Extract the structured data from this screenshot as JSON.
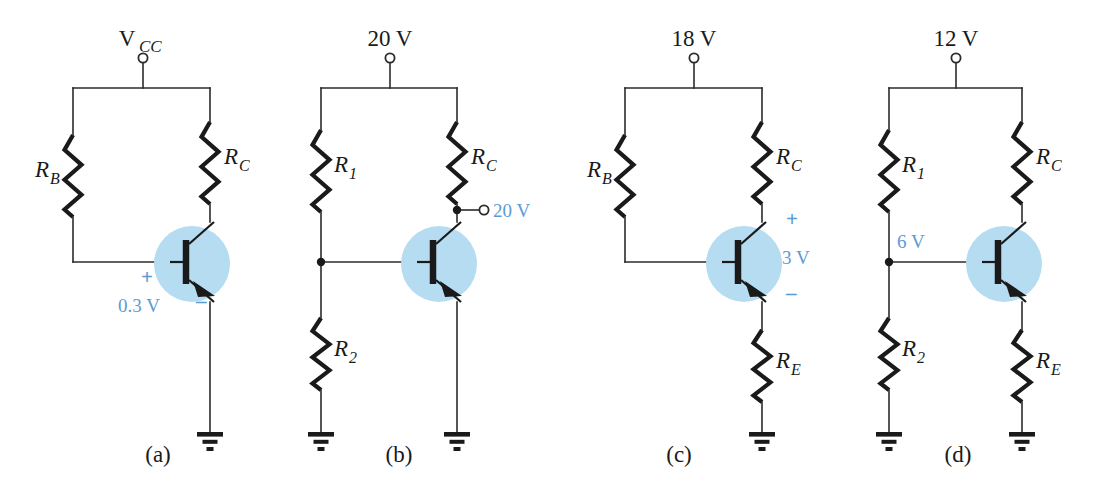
{
  "figure": {
    "width": 1094,
    "height": 503,
    "background": "#ffffff",
    "wire_color": "#2b2b2b",
    "ink_color": "#1a1a1a",
    "highlight_fill": "#b6dcf2",
    "annotation_color": "#5b9bd5"
  },
  "circuits": [
    {
      "id": "a",
      "caption": "(a)",
      "caption_x": 158,
      "caption_y": 462,
      "supply": {
        "label": "V",
        "sub": "CC",
        "x": 143,
        "terminal_y": 58,
        "rail_y": 88
      },
      "left_rail_x": 73,
      "right_rail_x": 210,
      "base_line_y": 262,
      "ground_y": 432,
      "resistors": [
        {
          "name": "R",
          "sub": "B",
          "x": 73,
          "y": 135,
          "h": 82,
          "label_side": "left",
          "label_dx": -34,
          "label_dy": 42
        },
        {
          "name": "R",
          "sub": "C",
          "x": 210,
          "y": 122,
          "h": 82,
          "label_side": "right",
          "label_dx": 14,
          "label_dy": 42
        }
      ],
      "transistor": {
        "cx": 186,
        "cy": 262,
        "highlight_r": 38
      },
      "annotations": [
        {
          "text": "+",
          "x": 141,
          "y": 284,
          "size": 21,
          "bold": true
        },
        {
          "text": "0.3 V",
          "x": 118,
          "y": 312,
          "size": 19,
          "bold": false
        },
        {
          "text": "–",
          "x": 196,
          "y": 308,
          "size": 21,
          "bold": true
        }
      ],
      "terminals": [],
      "grounds": [
        {
          "x": 210,
          "y": 432
        }
      ],
      "junctions": []
    },
    {
      "id": "b",
      "caption": "(b)",
      "caption_x": 399,
      "caption_y": 462,
      "supply": {
        "label": "20 V",
        "sub": "",
        "x": 390,
        "terminal_y": 58,
        "rail_y": 88
      },
      "left_rail_x": 321,
      "right_rail_x": 457,
      "base_line_y": 262,
      "ground_y": 432,
      "resistors": [
        {
          "name": "R",
          "sub": "1",
          "x": 321,
          "y": 130,
          "h": 82,
          "label_side": "right",
          "label_dx": 13,
          "label_dy": 42
        },
        {
          "name": "R",
          "sub": "C",
          "x": 457,
          "y": 122,
          "h": 82,
          "label_side": "right",
          "label_dx": 14,
          "label_dy": 42
        },
        {
          "name": "R",
          "sub": "2",
          "x": 321,
          "y": 318,
          "h": 72,
          "label_side": "right",
          "label_dx": 13,
          "label_dy": 38
        }
      ],
      "transistor": {
        "cx": 433,
        "cy": 262,
        "highlight_r": 38
      },
      "annotations": [
        {
          "text": "20 V",
          "x": 493,
          "y": 217,
          "size": 19,
          "bold": false
        }
      ],
      "terminals": [
        {
          "x": 484,
          "y": 210,
          "from_x": 457,
          "from_y": 210
        }
      ],
      "grounds": [
        {
          "x": 321,
          "y": 432
        },
        {
          "x": 457,
          "y": 432
        }
      ],
      "junctions": [
        {
          "x": 321,
          "y": 262
        },
        {
          "x": 457,
          "y": 210
        }
      ]
    },
    {
      "id": "c",
      "caption": "(c)",
      "caption_x": 679,
      "caption_y": 462,
      "supply": {
        "label": "18 V",
        "sub": "",
        "x": 694,
        "terminal_y": 58,
        "rail_y": 88
      },
      "left_rail_x": 625,
      "right_rail_x": 762,
      "base_line_y": 262,
      "ground_y": 432,
      "resistors": [
        {
          "name": "R",
          "sub": "B",
          "x": 625,
          "y": 135,
          "h": 82,
          "label_side": "left",
          "label_dx": -34,
          "label_dy": 42
        },
        {
          "name": "R",
          "sub": "C",
          "x": 762,
          "y": 122,
          "h": 82,
          "label_side": "right",
          "label_dx": 14,
          "label_dy": 42
        },
        {
          "name": "R",
          "sub": "E",
          "x": 762,
          "y": 330,
          "h": 72,
          "label_side": "right",
          "label_dx": 14,
          "label_dy": 38
        }
      ],
      "transistor": {
        "cx": 738,
        "cy": 262,
        "highlight_r": 38
      },
      "annotations": [
        {
          "text": "+",
          "x": 786,
          "y": 226,
          "size": 21,
          "bold": true
        },
        {
          "text": "3 V",
          "x": 782,
          "y": 264,
          "size": 19,
          "bold": false
        },
        {
          "text": "–",
          "x": 786,
          "y": 300,
          "size": 21,
          "bold": true
        }
      ],
      "terminals": [],
      "grounds": [
        {
          "x": 762,
          "y": 432
        }
      ],
      "junctions": []
    },
    {
      "id": "d",
      "caption": "(d)",
      "caption_x": 958,
      "caption_y": 462,
      "supply": {
        "label": "12 V",
        "sub": "",
        "x": 956,
        "terminal_y": 58,
        "rail_y": 88
      },
      "left_rail_x": 889,
      "right_rail_x": 1022,
      "base_line_y": 262,
      "ground_y": 432,
      "resistors": [
        {
          "name": "R",
          "sub": "1",
          "x": 889,
          "y": 130,
          "h": 82,
          "label_side": "right",
          "label_dx": 13,
          "label_dy": 42
        },
        {
          "name": "R",
          "sub": "C",
          "x": 1022,
          "y": 122,
          "h": 82,
          "label_side": "right",
          "label_dx": 14,
          "label_dy": 42
        },
        {
          "name": "R",
          "sub": "2",
          "x": 889,
          "y": 318,
          "h": 72,
          "label_side": "right",
          "label_dx": 13,
          "label_dy": 38
        },
        {
          "name": "R",
          "sub": "E",
          "x": 1022,
          "y": 330,
          "h": 72,
          "label_side": "right",
          "label_dx": 14,
          "label_dy": 38
        }
      ],
      "transistor": {
        "cx": 998,
        "cy": 262,
        "highlight_r": 38
      },
      "annotations": [
        {
          "text": "6 V",
          "x": 897,
          "y": 248,
          "size": 19,
          "bold": false
        }
      ],
      "terminals": [],
      "grounds": [
        {
          "x": 889,
          "y": 432
        },
        {
          "x": 1022,
          "y": 432
        }
      ],
      "junctions": [
        {
          "x": 889,
          "y": 262
        }
      ]
    }
  ]
}
